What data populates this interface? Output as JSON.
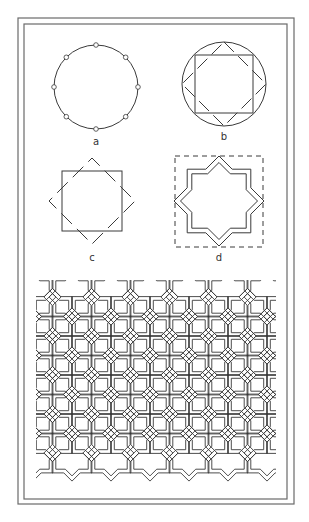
{
  "figure": {
    "colors": {
      "stroke": "#3a3a3a",
      "frame": "#6a6a6a",
      "background": "#ffffff"
    },
    "frame": {
      "outer": {
        "x": 18,
        "y": 18,
        "w": 276,
        "h": 486
      },
      "inner": {
        "x": 24,
        "y": 24,
        "w": 263,
        "h": 475
      }
    },
    "panels": {
      "a": {
        "label": "a",
        "label_pos": [
          96,
          145
        ],
        "circle": {
          "cx": 96,
          "cy": 87,
          "r": 42
        },
        "division_points": 8
      },
      "b": {
        "label": "b",
        "label_pos": [
          224,
          140
        ],
        "circle": {
          "cx": 224,
          "cy": 84,
          "r": 42
        },
        "square_half": 29
      },
      "c": {
        "label": "c",
        "label_pos": [
          92,
          261
        ],
        "center": [
          92,
          201
        ],
        "square_half": 30,
        "diamond_half": 43
      },
      "d": {
        "label": "d",
        "label_pos": [
          219,
          261
        ],
        "center": [
          219,
          201
        ],
        "dashed_box": {
          "x": 175,
          "y": 156,
          "w": 88,
          "h": 91
        },
        "star_outer": 45,
        "band_gap": 2.5
      },
      "pattern": {
        "clip": {
          "x": 36,
          "y": 280,
          "w": 240,
          "h": 205
        },
        "origin": [
          72,
          297
        ],
        "spacing": 39,
        "cols": 7,
        "rows": 6,
        "band_gap": 2
      }
    }
  }
}
